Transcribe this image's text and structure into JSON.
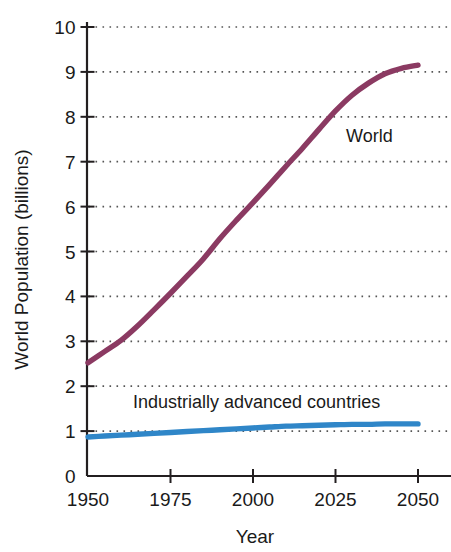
{
  "chart_data": {
    "type": "line",
    "title": "",
    "xlabel": "Year",
    "ylabel": "World Population (billions)",
    "xlim": [
      1950,
      2057
    ],
    "ylim": [
      0,
      10.4
    ],
    "x_ticks": [
      1950,
      1975,
      2000,
      2025,
      2050
    ],
    "y_ticks": [
      0,
      1,
      2,
      3,
      4,
      5,
      6,
      7,
      8,
      9,
      10
    ],
    "grid": "horizontal-dotted",
    "legend": "inline-labels",
    "series": [
      {
        "name": "World",
        "color": "#8b3a62",
        "label_text": "World",
        "x": [
          1950,
          1955,
          1960,
          1965,
          1970,
          1975,
          1980,
          1985,
          1990,
          1995,
          2000,
          2005,
          2010,
          2015,
          2020,
          2025,
          2030,
          2035,
          2040,
          2045,
          2050
        ],
        "values": [
          2.52,
          2.77,
          3.02,
          3.34,
          3.7,
          4.07,
          4.45,
          4.84,
          5.29,
          5.7,
          6.09,
          6.49,
          6.9,
          7.3,
          7.72,
          8.13,
          8.48,
          8.75,
          8.96,
          9.08,
          9.15
        ]
      },
      {
        "name": "Industrially advanced countries",
        "color": "#2f86c8",
        "label_text": "Industrially advanced countries",
        "x": [
          1950,
          1955,
          1960,
          1965,
          1970,
          1975,
          1980,
          1985,
          1990,
          1995,
          2000,
          2005,
          2010,
          2015,
          2020,
          2025,
          2030,
          2035,
          2040,
          2045,
          2050
        ],
        "values": [
          0.87,
          0.89,
          0.91,
          0.93,
          0.95,
          0.97,
          0.99,
          1.01,
          1.03,
          1.05,
          1.07,
          1.09,
          1.11,
          1.12,
          1.13,
          1.14,
          1.15,
          1.15,
          1.16,
          1.16,
          1.16
        ]
      }
    ]
  },
  "axes": {
    "y_tick_labels": [
      "10",
      "9",
      "8",
      "7",
      "6",
      "5",
      "4",
      "3",
      "2",
      "1",
      "0"
    ],
    "x_tick_labels": [
      "1950",
      "1975",
      "2000",
      "2025",
      "2050"
    ],
    "y_axis_title": "World Population (billions)",
    "x_axis_title": "Year"
  },
  "colors": {
    "world_line": "#8b3a62",
    "iac_line": "#2f86c8",
    "axis": "#231f20",
    "grid": "#555555",
    "text": "#1a1a1a",
    "background": "#ffffff"
  }
}
